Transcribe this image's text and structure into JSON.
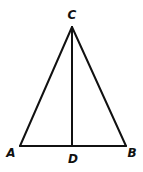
{
  "diagram": {
    "type": "triangle-with-median",
    "points": {
      "A": {
        "label": "A",
        "x": 20,
        "y": 146
      },
      "B": {
        "label": "B",
        "x": 126,
        "y": 146
      },
      "C": {
        "label": "C",
        "x": 72,
        "y": 27
      },
      "D": {
        "label": "D",
        "x": 72,
        "y": 146
      }
    },
    "segments": [
      "AC",
      "BC",
      "AB",
      "CD"
    ],
    "colors": {
      "stroke": "#111111",
      "background": "#ffffff"
    }
  }
}
